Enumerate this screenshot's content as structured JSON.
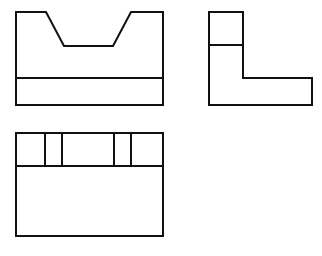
{
  "drawing": {
    "title": "Orthographic Three-View Engineering Drawing",
    "background_color": "#ffffff",
    "line_color": "#111111",
    "line_width": 2,
    "canvas": {
      "width": 322,
      "height": 256
    },
    "projection": "third-angle",
    "views": [
      {
        "id": "front-view",
        "label": "Front View",
        "description": "Rectangular block with symmetric trapezoidal V-notch cut into the top edge and a horizontal base band line",
        "bounds": {
          "x": 16,
          "y": 12,
          "width": 147,
          "height": 93
        },
        "outline_points": "16,12 46,12 64,46 113,46 131,12 163,12 163,105 16,105",
        "notch": {
          "top_left_x": 46,
          "bottom_left_x": 64,
          "bottom_right_x": 113,
          "top_right_x": 131,
          "top_y": 12,
          "bottom_y": 46
        },
        "interior_lines": [
          {
            "name": "base-band-line",
            "x1": 16,
            "y1": 78,
            "x2": 163,
            "y2": 78
          }
        ]
      },
      {
        "id": "right-side-view",
        "label": "Right Side View",
        "description": "L-shaped profile with a small square subdivision at the upper vertical leg",
        "bounds": {
          "x": 209,
          "y": 12,
          "width": 103,
          "height": 93
        },
        "outline_points": "209,12 243,12 243,78 312,78 312,105 209,105",
        "interior_lines": [
          {
            "name": "upper-leg-divider-line",
            "x1": 209,
            "y1": 45,
            "x2": 243,
            "y2": 45
          }
        ]
      },
      {
        "id": "top-view",
        "label": "Top View",
        "description": "Rectangle with a horizontal band across the top subdivided by four vertical partition lines",
        "bounds": {
          "x": 16,
          "y": 133,
          "width": 147,
          "height": 103
        },
        "outline_points": "16,133 163,133 163,236 16,236",
        "interior_lines": [
          {
            "name": "band-divider-line",
            "x1": 16,
            "y1": 166,
            "x2": 163,
            "y2": 166
          },
          {
            "name": "partition-line-1",
            "x1": 45,
            "y1": 133,
            "x2": 45,
            "y2": 166
          },
          {
            "name": "partition-line-2",
            "x1": 62,
            "y1": 133,
            "x2": 62,
            "y2": 166
          },
          {
            "name": "partition-line-3",
            "x1": 114,
            "y1": 133,
            "x2": 114,
            "y2": 166
          },
          {
            "name": "partition-line-4",
            "x1": 131,
            "y1": 133,
            "x2": 131,
            "y2": 166
          }
        ]
      }
    ]
  }
}
